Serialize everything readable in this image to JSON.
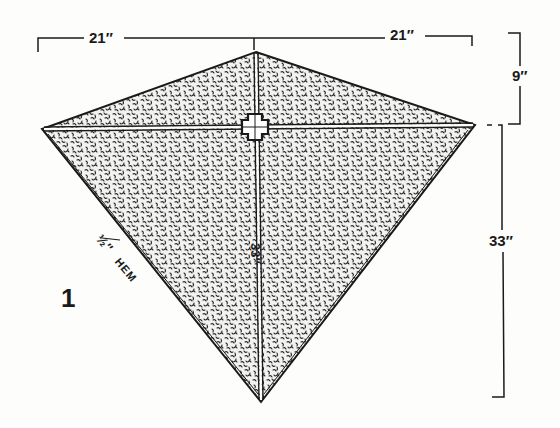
{
  "figure": {
    "number": "1",
    "type": "kite construction diagram"
  },
  "dimensions": {
    "top_left_width": "21″",
    "top_right_width": "21″",
    "top_height": "9″",
    "bottom_height": "33″",
    "vertical_spar": "33″"
  },
  "annotations": {
    "hem_fraction": "½″",
    "hem_label": "HEM"
  },
  "colors": {
    "ink": "#1a1a1a",
    "paper": "#fdfdfc",
    "fill_pattern": "stipple"
  }
}
